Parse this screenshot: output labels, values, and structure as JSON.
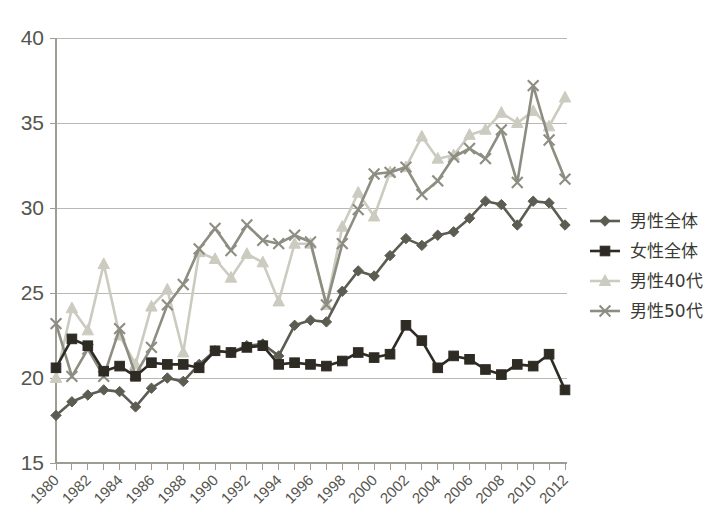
{
  "chart_data": {
    "type": "line",
    "title": "",
    "subtitle": "",
    "xlabel": "",
    "ylabel": "",
    "xlim": [
      1980,
      2012
    ],
    "ylim": [
      15,
      40
    ],
    "y_ticks": [
      15,
      20,
      25,
      30,
      35,
      40
    ],
    "x_ticks_labeled": [
      1980,
      1982,
      1984,
      1986,
      1988,
      1990,
      1992,
      1994,
      1996,
      1998,
      2000,
      2002,
      2004,
      2006,
      2008,
      2010,
      2012
    ],
    "x_tick_interval": 1,
    "grid": "horizontal",
    "legend_position": "right",
    "x": [
      1980,
      1981,
      1982,
      1983,
      1984,
      1985,
      1986,
      1987,
      1988,
      1989,
      1990,
      1991,
      1992,
      1993,
      1994,
      1995,
      1996,
      1997,
      1998,
      1999,
      2000,
      2001,
      2002,
      2003,
      2004,
      2005,
      2006,
      2007,
      2008,
      2009,
      2010,
      2011,
      2012
    ],
    "series": [
      {
        "name": "男性全体",
        "marker": "diamond",
        "color": "#5c5c52",
        "values": [
          17.8,
          18.6,
          19.0,
          19.3,
          19.2,
          18.3,
          19.4,
          20.0,
          19.8,
          20.8,
          21.6,
          21.5,
          21.9,
          22.0,
          21.3,
          23.1,
          23.4,
          23.3,
          25.1,
          26.3,
          26.0,
          27.2,
          28.2,
          27.8,
          28.4,
          28.6,
          29.4,
          30.4,
          30.2,
          29.0,
          30.4,
          30.3,
          29.0
        ]
      },
      {
        "name": "女性全体",
        "marker": "square",
        "color": "#2e2a24",
        "values": [
          20.6,
          22.3,
          21.9,
          20.4,
          20.7,
          20.1,
          20.9,
          20.8,
          20.8,
          20.6,
          21.6,
          21.5,
          21.8,
          21.9,
          20.8,
          20.9,
          20.8,
          20.7,
          21.0,
          21.5,
          21.2,
          21.4,
          23.1,
          22.2,
          20.6,
          21.3,
          21.1,
          20.5,
          20.2,
          20.8,
          20.7,
          21.4,
          19.3
        ]
      },
      {
        "name": "男性40代",
        "marker": "triangle",
        "color": "#cccbc0",
        "values": [
          20.0,
          24.1,
          22.8,
          26.7,
          22.5,
          20.8,
          24.2,
          25.2,
          21.5,
          27.4,
          27.0,
          25.9,
          27.3,
          26.8,
          24.5,
          27.9,
          27.9,
          24.3,
          28.9,
          30.9,
          29.5,
          32.1,
          32.4,
          34.2,
          32.9,
          33.1,
          34.3,
          34.6,
          35.6,
          35.0,
          35.7,
          34.8,
          36.5
        ]
      },
      {
        "name": "男性50代",
        "marker": "x",
        "color": "#8d8d82"
      }
    ]
  },
  "series4_values": [
    23.2,
    20.1,
    21.7,
    20.1,
    22.9,
    20.2,
    21.8,
    24.3,
    25.5,
    27.6,
    28.8,
    27.5,
    29.0,
    28.1,
    27.9,
    28.4,
    28.0,
    24.3,
    27.9,
    29.9,
    32.0,
    32.1,
    32.4,
    30.8,
    31.6,
    33.0,
    33.5,
    32.9,
    34.6,
    31.5,
    37.2,
    34.0,
    31.7
  ],
  "legend": {
    "items": [
      {
        "label": "男性全体",
        "marker": "diamond",
        "color": "#5c5c52"
      },
      {
        "label": "女性全体",
        "marker": "square",
        "color": "#2e2a24"
      },
      {
        "label": "男性40代",
        "marker": "triangle",
        "color": "#cccbc0"
      },
      {
        "label": "男性50代",
        "marker": "x",
        "color": "#8d8d82"
      }
    ]
  },
  "axis": {
    "y_labels": [
      "40",
      "35",
      "30",
      "25",
      "20",
      "15"
    ],
    "x_labels": [
      "1980",
      "1982",
      "1984",
      "1986",
      "1988",
      "1990",
      "1992",
      "1994",
      "1996",
      "1998",
      "2000",
      "2002",
      "2004",
      "2006",
      "2008",
      "2010",
      "2012"
    ]
  },
  "colors": {
    "background": "#ffffff",
    "grid": "#b9b9b2",
    "axis": "#9d9d95",
    "text": "#55554e"
  }
}
